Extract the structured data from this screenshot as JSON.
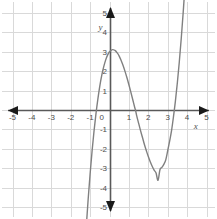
{
  "figure": {
    "name": "cubic-function-graph",
    "background_color": "#ffffff",
    "width": 217,
    "height": 219
  },
  "chart_data": {
    "type": "line",
    "title": "",
    "subtitle": "",
    "xlabel": "x",
    "ylabel": "y",
    "xlim": [
      -5,
      5
    ],
    "ylim": [
      -5,
      5
    ],
    "grid": true,
    "grid_step": 1,
    "legend": "none",
    "axis_arrows": [
      "left",
      "right",
      "up",
      "down"
    ],
    "x_ticks": [
      -5,
      -4,
      -3,
      -2,
      -1,
      0,
      1,
      2,
      3,
      4,
      5
    ],
    "x_tick_labels": [
      "-5",
      "-4",
      "-3",
      "-2",
      "-1",
      "0",
      "1",
      "2",
      "3",
      "4",
      "5"
    ],
    "y_ticks": [
      -5,
      -4,
      -3,
      -2,
      -1,
      1,
      2,
      3,
      4,
      5
    ],
    "y_tick_labels": [
      "-5",
      "-4",
      "-3",
      "-2",
      "-1",
      "1",
      "2",
      "3",
      "4",
      "5"
    ],
    "series": [
      {
        "name": "cubic-curve",
        "color": "#808080",
        "line_width": 1.4,
        "expression": "y = x^3 - 4x^2 + 1.3x + 3",
        "x_domain": [
          -1.58,
          4.02
        ],
        "points": [
          {
            "x": -1.58,
            "y": -12.98
          },
          {
            "x": -1.5,
            "y": -11.32
          },
          {
            "x": -1.4,
            "y": -9.4
          },
          {
            "x": -1.3,
            "y": -7.65
          },
          {
            "x": -1.2,
            "y": -6.05
          },
          {
            "x": -1.1,
            "y": -4.6
          },
          {
            "x": -1.0,
            "y": -3.3
          },
          {
            "x": -0.9,
            "y": -2.14
          },
          {
            "x": -0.8,
            "y": -1.11
          },
          {
            "x": -0.7,
            "y": -0.21
          },
          {
            "x": -0.6,
            "y": 0.56
          },
          {
            "x": -0.5,
            "y": 1.23
          },
          {
            "x": -0.4,
            "y": 1.78
          },
          {
            "x": -0.3,
            "y": 2.22
          },
          {
            "x": -0.2,
            "y": 2.57
          },
          {
            "x": -0.1,
            "y": 2.83
          },
          {
            "x": 0.0,
            "y": 3.0
          },
          {
            "x": 0.1,
            "y": 3.09
          },
          {
            "x": 0.17,
            "y": 3.11
          },
          {
            "x": 0.3,
            "y": 3.06
          },
          {
            "x": 0.4,
            "y": 2.94
          },
          {
            "x": 0.5,
            "y": 2.78
          },
          {
            "x": 0.6,
            "y": 2.55
          },
          {
            "x": 0.7,
            "y": 2.29
          },
          {
            "x": 0.8,
            "y": 1.99
          },
          {
            "x": 0.9,
            "y": 1.66
          },
          {
            "x": 1.0,
            "y": 1.3
          },
          {
            "x": 1.1,
            "y": 0.92
          },
          {
            "x": 1.2,
            "y": 0.53
          },
          {
            "x": 1.3,
            "y": 0.13
          },
          {
            "x": 1.34,
            "y": 0.0
          },
          {
            "x": 1.4,
            "y": -0.29
          },
          {
            "x": 1.5,
            "y": -0.68
          },
          {
            "x": 1.6,
            "y": -1.06
          },
          {
            "x": 1.7,
            "y": -1.42
          },
          {
            "x": 1.8,
            "y": -1.78
          },
          {
            "x": 1.9,
            "y": -2.1
          },
          {
            "x": 2.0,
            "y": -2.4
          },
          {
            "x": 2.1,
            "y": -2.67
          },
          {
            "x": 2.2,
            "y": -2.9
          },
          {
            "x": 2.3,
            "y": -3.1
          },
          {
            "x": 2.4,
            "y": -3.25
          },
          {
            "x": 2.5,
            "y": -3.625
          },
          {
            "x": 2.6,
            "y": -3.08
          },
          {
            "x": 2.7,
            "y": -2.96
          },
          {
            "x": 2.8,
            "y": -2.8
          },
          {
            "x": 2.9,
            "y": -2.57
          },
          {
            "x": 3.0,
            "y": -2.1
          },
          {
            "x": 3.1,
            "y": -1.6
          },
          {
            "x": 3.2,
            "y": -1.05
          },
          {
            "x": 3.3,
            "y": -0.33
          },
          {
            "x": 3.4,
            "y": 0.48
          },
          {
            "x": 3.5,
            "y": 1.43
          },
          {
            "x": 3.6,
            "y": 2.5
          },
          {
            "x": 3.7,
            "y": 3.71
          },
          {
            "x": 3.8,
            "y": 5.05
          },
          {
            "x": 3.9,
            "y": 6.55
          },
          {
            "x": 4.02,
            "y": 8.5
          }
        ],
        "features": {
          "x_intercepts": [
            -0.68,
            1.8,
            3.1
          ],
          "local_maximum": {
            "x": 0.17,
            "y": 3.0
          },
          "local_minimum": {
            "x": 2.45,
            "y": -1.05
          },
          "y_intercept": 3.0
        }
      }
    ],
    "colors": {
      "grid": "#d9d9d9",
      "axis": "#595959",
      "curve": "#808080",
      "tick_label": "#4d4d4d"
    }
  }
}
